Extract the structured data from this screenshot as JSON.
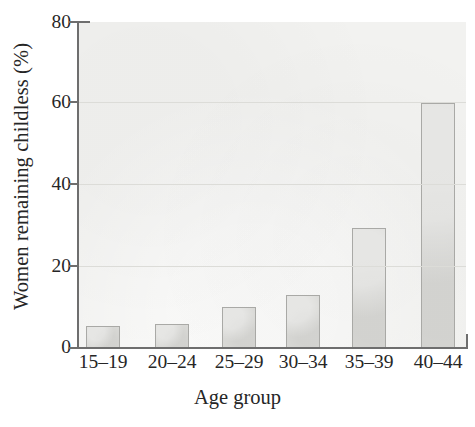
{
  "chart_data": {
    "type": "bar",
    "title": "",
    "subtitle": "",
    "xlabel": "Age group",
    "ylabel": "Women remaining childless (%)",
    "categories": [
      "15–19",
      "20–24",
      "25–29",
      "30–34",
      "35–39",
      "40–44"
    ],
    "values": [
      5.5,
      6,
      10,
      13,
      29.5,
      60
    ],
    "ylim": [
      0,
      80
    ],
    "yticks": [
      0,
      20,
      40,
      60,
      80
    ],
    "ytick_labels": [
      "0",
      "20",
      "40",
      "60",
      "80"
    ],
    "grid": "horizontal",
    "legend": "none",
    "annotations": [],
    "colors": {
      "bar_fill": "#d9d9d6",
      "bar_edge": "#a9a9a6",
      "panel_background": "#f2f2f0",
      "gridline": "#dcdcd8",
      "axis": "#6e6e6e",
      "text": "#262626",
      "figure_background": "#ffffff"
    }
  },
  "axes": {
    "y": {
      "ticks": [
        {
          "label": "80",
          "value": 80
        },
        {
          "label": "60",
          "value": 60
        },
        {
          "label": "40",
          "value": 40
        },
        {
          "label": "20",
          "value": 20
        },
        {
          "label": "0",
          "value": 0
        }
      ]
    },
    "x": {
      "ticks": [
        {
          "label": "15–19"
        },
        {
          "label": "20–24"
        },
        {
          "label": "25–29"
        },
        {
          "label": "30–34"
        },
        {
          "label": "35–39"
        },
        {
          "label": "40–44"
        }
      ]
    }
  }
}
